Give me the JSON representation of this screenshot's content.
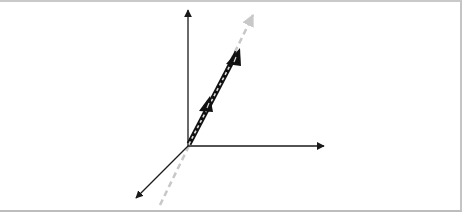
{
  "diagram": {
    "title": "",
    "colors": {
      "axis": "#1a1a1a",
      "vector": "#111111",
      "guide_dashed": "#c8c8c8",
      "vector_inner_dash": "#e0e0e0",
      "frame": "#c4c4c4"
    },
    "axes": [
      {
        "name": "vertical-axis"
      },
      {
        "name": "horizontal-axis"
      },
      {
        "name": "depth-axis"
      }
    ],
    "vector": {
      "arrowheads": 2,
      "style": "black-white-dashed"
    },
    "guide_line": {
      "style": "light-gray-dashed",
      "arrowhead": true
    }
  }
}
